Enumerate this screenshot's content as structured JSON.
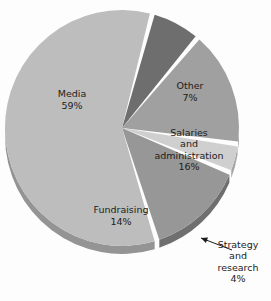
{
  "chart_data": {
    "type": "pie",
    "title": "",
    "subtitle": "",
    "xlabel": "",
    "ylabel": "",
    "legend_position": "none",
    "grid": false,
    "labels_inside": true,
    "slices": [
      {
        "name": "Other",
        "value": 7,
        "value_label": "7%",
        "label": "Other",
        "color": "#6e6e6e",
        "side_color": "#525252",
        "label_x": 190,
        "label_y": 92,
        "label_lines": [
          "Other",
          "7%"
        ],
        "callout": false
      },
      {
        "name": "Salaries and administration",
        "value": 16,
        "value_label": "16%",
        "label": "Salaries and administration",
        "color": "#a0a0a0",
        "side_color": "#7b7b7b",
        "label_x": 189,
        "label_y": 150,
        "label_lines": [
          "Salaries",
          "and",
          "administration",
          "16%"
        ],
        "callout": false
      },
      {
        "name": "Strategy and research",
        "value": 4,
        "value_label": "4%",
        "label": "Strategy and research",
        "color": "#cfcfcf",
        "side_color": "#a6a6a6",
        "label_x": 238,
        "label_y": 262,
        "label_lines": [
          "Strategy",
          "and",
          "research",
          "4%"
        ],
        "callout": true
      },
      {
        "name": "Fundraising",
        "value": 14,
        "value_label": "14%",
        "label": "Fundraising",
        "color": "#979797",
        "side_color": "#6f6f6f",
        "label_x": 121,
        "label_y": 216,
        "label_lines": [
          "Fundraising",
          "14%"
        ],
        "callout": false
      },
      {
        "name": "Media",
        "value": 59,
        "value_label": "59%",
        "label": "Media",
        "color": "#bdbdbd",
        "side_color": "#949494",
        "label_x": 72,
        "label_y": 100,
        "label_lines": [
          "Media",
          "59%"
        ],
        "callout": false
      }
    ],
    "total": 100,
    "background_color": "#fdfdfd",
    "text_color": "#1c1c1c",
    "callout_arrow": {
      "from_x": 232,
      "from_y": 250,
      "to_x": 201,
      "to_y": 238
    }
  }
}
